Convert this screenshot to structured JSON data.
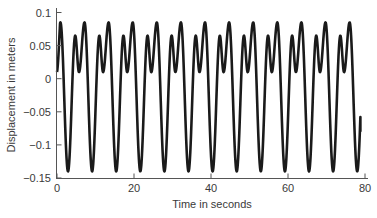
{
  "chart_data": {
    "type": "line",
    "title": "",
    "xlabel": "Time in seconds",
    "ylabel": "Displacement in meters",
    "xlim": [
      0,
      80
    ],
    "ylim": [
      -0.15,
      0.1
    ],
    "xticks": [
      0,
      20,
      40,
      60,
      80
    ],
    "xtick_labels": [
      "0",
      "20",
      "40",
      "60",
      "80"
    ],
    "yticks": [
      0.1,
      0.05,
      0,
      -0.05,
      -0.1,
      -0.15
    ],
    "ytick_labels": [
      "0.1",
      "0.05",
      "0",
      "−0.05",
      "−0.1",
      "−0.15"
    ],
    "grid": false,
    "legend": null,
    "series": [
      {
        "name": "displacement",
        "color": "#1a1a1a",
        "description": "Periodic oscillation, period ~6.26 s; each cycle: trough -0.14, minor peak 0.065, shallow dip 0.01, major peak 0.085",
        "start": {
          "t": 0,
          "value": 0.01
        },
        "end": {
          "t": 78.8,
          "value": -0.08
        },
        "period": 6.26,
        "first_trough_t": 2.86,
        "cycle_shape": [
          {
            "phase": 0.0,
            "value": -0.14
          },
          {
            "phase": 0.3,
            "value": 0.065
          },
          {
            "phase": 0.455,
            "value": 0.01
          },
          {
            "phase": 0.685,
            "value": 0.085
          },
          {
            "phase": 1.0,
            "value": -0.14
          }
        ],
        "trough_times": [
          2.86,
          9.12,
          15.38,
          21.64,
          27.9,
          34.16,
          40.42,
          46.68,
          52.94,
          59.2,
          65.46,
          71.72,
          77.98
        ]
      }
    ]
  },
  "colors": {
    "line": "#1a1a1a",
    "axis": "#555555",
    "text": "#3a3a3a",
    "background": "#ffffff"
  }
}
